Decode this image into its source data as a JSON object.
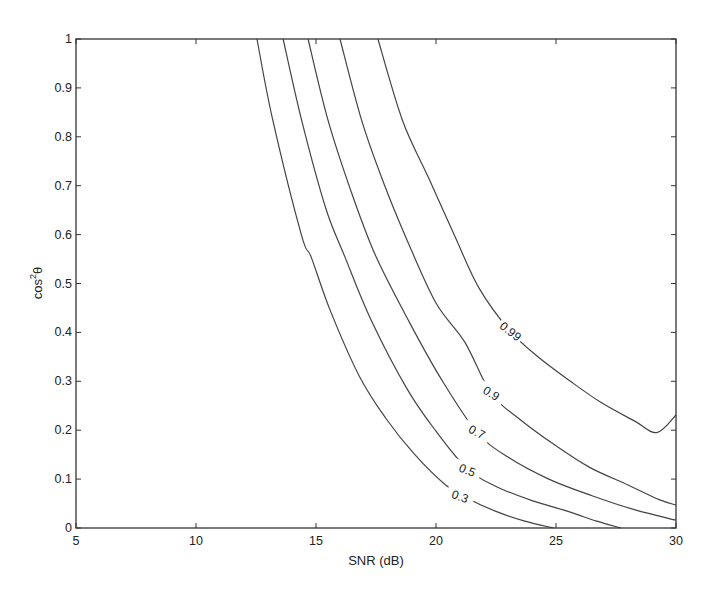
{
  "chart_data": {
    "type": "line",
    "subtype": "contour",
    "title": "",
    "xlabel": "SNR (dB)",
    "ylabel": "cos²θ",
    "ylabel_base": "cos",
    "ylabel_sup": "2",
    "ylabel_tail": "θ",
    "xlim": [
      5,
      30
    ],
    "ylim": [
      0,
      1
    ],
    "xticks": [
      5,
      10,
      15,
      20,
      25,
      30
    ],
    "yticks": [
      0,
      0.1,
      0.2,
      0.3,
      0.4,
      0.5,
      0.6,
      0.7,
      0.8,
      0.9,
      1
    ],
    "ytick_labels": [
      "0",
      "0.1",
      "0.2",
      "0.3",
      "0.4",
      "0.5",
      "0.6",
      "0.7",
      "0.8",
      "0.9",
      "1"
    ],
    "xtick_labels": [
      "5",
      "10",
      "15",
      "20",
      "25",
      "30"
    ],
    "grid": false,
    "legend": null,
    "series": [
      {
        "name": "0.3",
        "label_at": [
          21.0,
          0.064
        ],
        "label_angle": 20,
        "points": [
          [
            12.54,
            1.0
          ],
          [
            13.2,
            0.834
          ],
          [
            14.4,
            0.598
          ],
          [
            14.8,
            0.554
          ],
          [
            15.6,
            0.444
          ],
          [
            16.8,
            0.311
          ],
          [
            17.9,
            0.225
          ],
          [
            19.1,
            0.151
          ],
          [
            20.4,
            0.088
          ],
          [
            21.3,
            0.061
          ],
          [
            22.5,
            0.034
          ],
          [
            23.7,
            0.014
          ],
          [
            24.9,
            0.0
          ]
        ]
      },
      {
        "name": "0.5",
        "label_at": [
          21.3,
          0.118
        ],
        "label_angle": 22,
        "points": [
          [
            13.63,
            1.0
          ],
          [
            14.4,
            0.834
          ],
          [
            15.4,
            0.655
          ],
          [
            16.2,
            0.555
          ],
          [
            17.3,
            0.425
          ],
          [
            18.8,
            0.284
          ],
          [
            20.0,
            0.198
          ],
          [
            21.3,
            0.121
          ],
          [
            22.5,
            0.085
          ],
          [
            24.0,
            0.056
          ],
          [
            25.5,
            0.034
          ],
          [
            26.7,
            0.014
          ],
          [
            27.7,
            0.0
          ]
        ]
      },
      {
        "name": "0.7",
        "label_at": [
          21.7,
          0.196
        ],
        "label_angle": 28,
        "points": [
          [
            14.67,
            1.0
          ],
          [
            15.5,
            0.834
          ],
          [
            16.5,
            0.683
          ],
          [
            17.5,
            0.555
          ],
          [
            18.9,
            0.42
          ],
          [
            20.2,
            0.306
          ],
          [
            21.7,
            0.196
          ],
          [
            23.0,
            0.145
          ],
          [
            24.7,
            0.1
          ],
          [
            26.5,
            0.066
          ],
          [
            28.3,
            0.037
          ],
          [
            30.0,
            0.016
          ]
        ]
      },
      {
        "name": "0.9",
        "label_at": [
          22.3,
          0.275
        ],
        "label_angle": 32,
        "points": [
          [
            16.0,
            1.0
          ],
          [
            16.9,
            0.834
          ],
          [
            17.8,
            0.708
          ],
          [
            18.8,
            0.588
          ],
          [
            20.0,
            0.46
          ],
          [
            21.2,
            0.38
          ],
          [
            22.3,
            0.275
          ],
          [
            23.5,
            0.222
          ],
          [
            25.0,
            0.168
          ],
          [
            26.4,
            0.124
          ],
          [
            28.0,
            0.088
          ],
          [
            29.3,
            0.058
          ],
          [
            30.0,
            0.047
          ]
        ]
      },
      {
        "name": "0.99",
        "label_at": [
          23.1,
          0.402
        ],
        "label_angle": 38,
        "points": [
          [
            17.58,
            1.0
          ],
          [
            18.6,
            0.834
          ],
          [
            19.7,
            0.715
          ],
          [
            20.8,
            0.595
          ],
          [
            21.8,
            0.49
          ],
          [
            23.1,
            0.402
          ],
          [
            24.3,
            0.348
          ],
          [
            25.6,
            0.3
          ],
          [
            26.9,
            0.256
          ],
          [
            28.3,
            0.218
          ],
          [
            29.2,
            0.195
          ],
          [
            30.0,
            0.231
          ]
        ]
      }
    ]
  }
}
